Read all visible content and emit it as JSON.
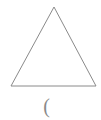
{
  "figure": {
    "background_color": "#ffffff",
    "stroke_color": "#8a8a8a",
    "stroke_width": 1,
    "canvas": {
      "width": 101,
      "height": 120
    },
    "shape": {
      "name": "triangle",
      "type": "polygon-outline",
      "filled": false,
      "vertices": [
        {
          "label": "apex",
          "x": 54,
          "y": 7
        },
        {
          "label": "bottom-left",
          "x": 11,
          "y": 86
        },
        {
          "label": "bottom-right",
          "x": 96,
          "y": 86
        }
      ],
      "points_attr": "54,7 11,86 96,86"
    },
    "caption": {
      "text": "(",
      "x": 48,
      "y": 107,
      "color": "#8a8a8a"
    }
  }
}
